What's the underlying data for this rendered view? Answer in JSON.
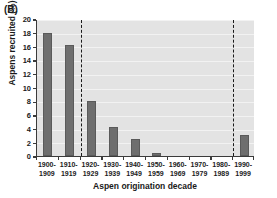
{
  "panel": {
    "label": "(B)"
  },
  "chart_data": {
    "type": "bar",
    "title": "",
    "panel_label": "(B)",
    "xlabel": "Aspen origination decade",
    "ylabel": "Aspens recruited (%)",
    "categories": [
      "1900-\n1909",
      "1910-\n1919",
      "1920-\n1929",
      "1930-\n1939",
      "1940-\n1949",
      "1950-\n1959",
      "1960-\n1969",
      "1970-\n1979",
      "1980-\n1989",
      "1990-\n1999"
    ],
    "category_lines": [
      [
        "1900-",
        "1909"
      ],
      [
        "1910-",
        "1919"
      ],
      [
        "1920-",
        "1929"
      ],
      [
        "1930-",
        "1939"
      ],
      [
        "1940-",
        "1949"
      ],
      [
        "1950-",
        "1959"
      ],
      [
        "1960-",
        "1969"
      ],
      [
        "1970-",
        "1979"
      ],
      [
        "1980-",
        "1989"
      ],
      [
        "1990-",
        "1999"
      ]
    ],
    "values": [
      18.0,
      16.2,
      8.0,
      4.3,
      2.5,
      0.5,
      0.0,
      0.0,
      0.0,
      3.0
    ],
    "ylim": [
      0,
      20
    ],
    "ytick_values": [
      0,
      2,
      4,
      6,
      8,
      10,
      12,
      14,
      16,
      18,
      20
    ],
    "ytick_labels": [
      "0",
      "2",
      "4",
      "6",
      "8",
      "10",
      "12",
      "14",
      "16",
      "18",
      "20"
    ],
    "grid": "horizontal",
    "legend": "none",
    "annotations": [
      {
        "type": "vline",
        "style": "dashed",
        "at_category_boundary": 2
      },
      {
        "type": "vline",
        "style": "dashed",
        "at_category_boundary": 9
      }
    ],
    "colors": {
      "bar": "#6e6e6e",
      "plot_background": "#e3e3e3",
      "axis": "#3b3b3b",
      "gridline": "#f2f2f2",
      "text": "#1a1a1a",
      "vline": "#1a1a1a"
    }
  }
}
